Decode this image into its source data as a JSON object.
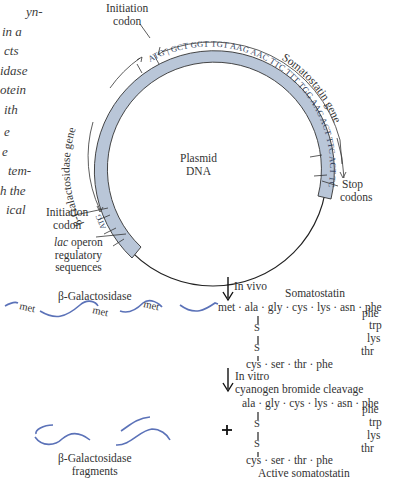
{
  "side_text": {
    "block1": [
      "yn-",
      "in a",
      "cts",
      "idase",
      "otein",
      "ith"
    ],
    "block2": [
      "e",
      "e",
      "tem-",
      "h the",
      "ical"
    ]
  },
  "plasmid": {
    "center_label": [
      "Plasmid",
      "DNA"
    ],
    "band_color": "#b9c6d8",
    "ring_color": "#222222",
    "codons": [
      "ATG",
      "GCT",
      "GGT",
      "TGT",
      "AAG",
      "AAC",
      "TTC",
      "TTT",
      "TGG",
      "AAG",
      "ACT",
      "TTC",
      "ACT",
      "TCG",
      "TGT",
      "TGA",
      "TAG"
    ],
    "lac_start_codon": "ATG",
    "labels": {
      "initiation_codon_top": [
        "Initiation",
        "codon"
      ],
      "somatostatin_gene": "Somatostatin gene",
      "beta_gal_gene": "β-Galactosidase gene",
      "stop_codons": [
        "Stop",
        "codons"
      ],
      "initiation_codon_left": [
        "Initiation",
        "codon"
      ],
      "lac_operon": [
        "lac",
        " operon",
        "regulatory",
        "sequences"
      ]
    }
  },
  "in_vivo": {
    "arrow_label": "In vivo",
    "beta_gal_label": "β-Galactosidase",
    "met_labels": [
      "met",
      "met",
      "met"
    ],
    "somatostatin_label": "Somatostatin",
    "chain_top": "met · ala · gly · cys · lys · asn · phe",
    "chain_side": [
      "phe",
      "trp",
      "lys",
      "thr"
    ],
    "chain_bottom": "cys · ser · thr · phe",
    "disulfide": [
      "S",
      "S"
    ]
  },
  "in_vitro": {
    "arrow_label": [
      "In vitro",
      "cyanogen bromide cleavage"
    ],
    "plus": "+",
    "fragments_label": [
      "β-Galactosidase",
      "fragments"
    ],
    "chain_top": "ala · gly · cys · lys · asn · phe",
    "chain_side": [
      "phe",
      "trp",
      "lys",
      "thr"
    ],
    "chain_bottom": "cys · ser · thr · phe",
    "disulfide": [
      "S",
      "S"
    ],
    "active_label": "Active somatostatin"
  },
  "colors": {
    "protein_wave": "#5b72b8",
    "text": "#333333"
  }
}
